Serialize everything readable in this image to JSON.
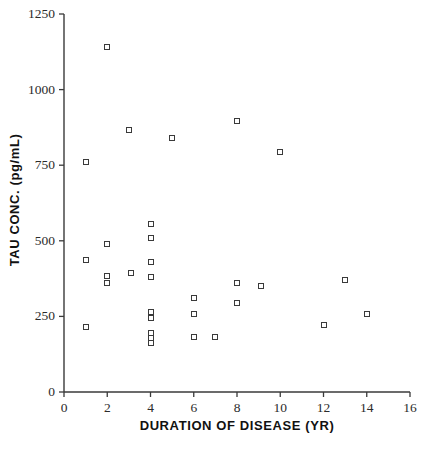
{
  "chart_data": {
    "type": "scatter",
    "title": "",
    "xlabel": "DURATION OF DISEASE (YR)",
    "ylabel": "TAU CONC. (pg/mL)",
    "xlim": [
      0,
      16
    ],
    "ylim": [
      0,
      1250
    ],
    "xticks": [
      0,
      2,
      4,
      6,
      8,
      10,
      12,
      14,
      16
    ],
    "yticks": [
      0,
      250,
      500,
      750,
      1000,
      1250
    ],
    "xtick_labels": [
      "0",
      "2",
      "4",
      "6",
      "8",
      "10",
      "12",
      "14",
      "16"
    ],
    "ytick_labels": [
      "0",
      "250",
      "500",
      "750",
      "1000",
      "1250"
    ],
    "grid": false,
    "legend": null,
    "marker": "open-square",
    "marker_color": "#3a3a3a",
    "n_points": 31,
    "x": [
      1,
      1,
      1,
      2,
      2,
      2,
      2,
      3,
      3,
      4,
      4,
      4,
      4,
      4,
      4,
      4,
      4,
      4,
      4,
      5,
      6,
      6,
      6,
      7,
      8,
      8,
      8,
      9,
      10,
      12,
      13,
      14
    ],
    "y": [
      760,
      435,
      215,
      1140,
      490,
      385,
      360,
      865,
      395,
      555,
      510,
      430,
      380,
      265,
      245,
      195,
      178,
      162,
      250,
      840,
      310,
      258,
      183,
      183,
      895,
      360,
      295,
      350,
      795,
      222,
      370,
      258
    ],
    "points": [
      {
        "x": 1,
        "y": 760
      },
      {
        "x": 1,
        "y": 435
      },
      {
        "x": 1,
        "y": 215
      },
      {
        "x": 2,
        "y": 1140
      },
      {
        "x": 2,
        "y": 490
      },
      {
        "x": 2,
        "y": 385
      },
      {
        "x": 2,
        "y": 360
      },
      {
        "x": 3,
        "y": 865
      },
      {
        "x": 3.1,
        "y": 395
      },
      {
        "x": 4,
        "y": 555
      },
      {
        "x": 4,
        "y": 510
      },
      {
        "x": 4,
        "y": 430
      },
      {
        "x": 4,
        "y": 380
      },
      {
        "x": 4,
        "y": 265
      },
      {
        "x": 4,
        "y": 245
      },
      {
        "x": 4,
        "y": 195
      },
      {
        "x": 4,
        "y": 178
      },
      {
        "x": 4,
        "y": 162
      },
      {
        "x": 5,
        "y": 840
      },
      {
        "x": 6,
        "y": 310
      },
      {
        "x": 6,
        "y": 258
      },
      {
        "x": 6,
        "y": 183
      },
      {
        "x": 7,
        "y": 183
      },
      {
        "x": 8,
        "y": 895
      },
      {
        "x": 8,
        "y": 360
      },
      {
        "x": 8,
        "y": 295
      },
      {
        "x": 9.1,
        "y": 350
      },
      {
        "x": 10,
        "y": 795
      },
      {
        "x": 12,
        "y": 222
      },
      {
        "x": 13,
        "y": 370
      },
      {
        "x": 14,
        "y": 258
      }
    ]
  }
}
